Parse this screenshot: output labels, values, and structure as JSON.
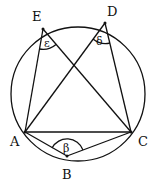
{
  "diagram": {
    "type": "inscribed-angles",
    "circle": {
      "cx": 78,
      "cy": 94,
      "r": 68
    },
    "points": {
      "A": {
        "label": "A",
        "x": 25,
        "y": 132
      },
      "B": {
        "label": "B",
        "x": 67,
        "y": 156
      },
      "C": {
        "label": "C",
        "x": 131,
        "y": 132
      },
      "D": {
        "label": "D",
        "x": 105,
        "y": 23
      },
      "E": {
        "label": "E",
        "x": 43,
        "y": 29
      }
    },
    "angles": {
      "epsilon": {
        "symbol": "ε",
        "vertex": "E"
      },
      "delta": {
        "symbol": "δ",
        "vertex": "D"
      },
      "beta": {
        "symbol": "β",
        "vertex": "B"
      }
    },
    "colors": {
      "stroke": "#111111",
      "background": "#ffffff"
    }
  }
}
